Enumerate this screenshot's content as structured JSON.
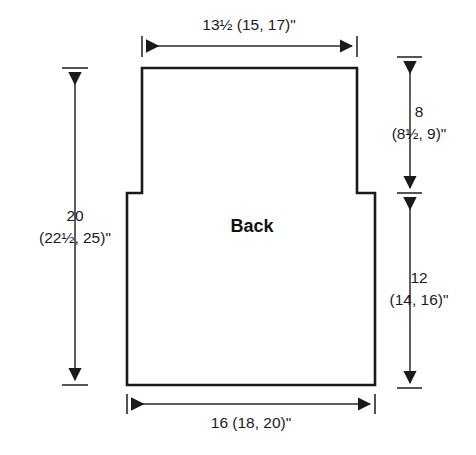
{
  "diagram": {
    "title": "Back",
    "piece_label": "Back",
    "units": "inches",
    "line_color": "#1a1a1a",
    "background_color": "#ffffff",
    "dimensions": {
      "top_width": {
        "name": "shoulder-width",
        "label": "13½ (15, 17)\"",
        "base": "13½",
        "alternates": "(15, 17)",
        "unit_mark": "\""
      },
      "bottom_width": {
        "name": "hem-width",
        "label": "16 (18, 20)\"",
        "base": "16",
        "alternates": "(18, 20)",
        "unit_mark": "\""
      },
      "total_height": {
        "name": "total-length",
        "line1": "20",
        "line2": "(22½, 25)\"",
        "base": "20",
        "alternates": "(22½, 25)",
        "unit_mark": "\""
      },
      "upper_height": {
        "name": "armhole-depth",
        "line1": "8",
        "line2": "(8½, 9)\"",
        "base": "8",
        "alternates": "(8½, 9)",
        "unit_mark": "\""
      },
      "lower_height": {
        "name": "body-length-to-underarm",
        "line1": "12",
        "line2": "(14, 16)\"",
        "base": "12",
        "alternates": "(14, 16)",
        "unit_mark": "\""
      }
    }
  }
}
